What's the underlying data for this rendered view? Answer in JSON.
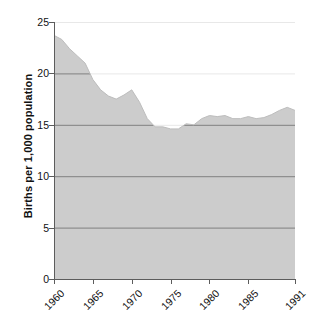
{
  "chart_data": {
    "type": "area",
    "title": "",
    "xlabel": "",
    "ylabel": "Births per 1,000 population",
    "xlim": [
      1960,
      1991
    ],
    "ylim": [
      0,
      25
    ],
    "grid": true,
    "legend": null,
    "xticks": [
      1960,
      1965,
      1970,
      1975,
      1980,
      1985,
      1991
    ],
    "xtick_labels": [
      "1960",
      "1965",
      "1970",
      "1975",
      "1980",
      "1985",
      "1991"
    ],
    "yticks": [
      0,
      5,
      10,
      15,
      20,
      25
    ],
    "ytick_labels": [
      "0",
      "5",
      "10",
      "15",
      "20",
      "25"
    ],
    "series": [
      {
        "name": "Birth rate",
        "fill_color": "#cccccc",
        "line_color": "#bdbdbd",
        "x": [
          1960,
          1961,
          1962,
          1963,
          1964,
          1965,
          1966,
          1967,
          1968,
          1969,
          1970,
          1971,
          1972,
          1973,
          1974,
          1975,
          1976,
          1977,
          1978,
          1979,
          1980,
          1981,
          1982,
          1983,
          1984,
          1985,
          1986,
          1987,
          1988,
          1989,
          1990,
          1991
        ],
        "values": [
          23.7,
          23.3,
          22.4,
          21.7,
          21.0,
          19.4,
          18.4,
          17.8,
          17.5,
          17.9,
          18.4,
          17.2,
          15.6,
          14.8,
          14.8,
          14.6,
          14.6,
          15.1,
          15.0,
          15.6,
          15.9,
          15.8,
          15.9,
          15.6,
          15.6,
          15.8,
          15.6,
          15.7,
          16.0,
          16.4,
          16.7,
          16.4
        ]
      }
    ],
    "colors": {
      "area_fill": "#cccccc",
      "gridline_over_fill": "#808080",
      "gridline_over_white": "#e8e8e8",
      "axis": "#5c5c5c",
      "text": "#111111",
      "background": "#ffffff"
    }
  }
}
